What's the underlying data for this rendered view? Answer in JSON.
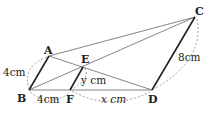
{
  "diagram": {
    "points": {
      "A": {
        "label": "A",
        "x": 49,
        "y": 56
      },
      "B": {
        "label": "B",
        "x": 29,
        "y": 90
      },
      "C": {
        "label": "C",
        "x": 195,
        "y": 17
      },
      "D": {
        "label": "D",
        "x": 152,
        "y": 90
      },
      "E": {
        "label": "E",
        "x": 83,
        "y": 67
      },
      "F": {
        "label": "F",
        "x": 70,
        "y": 90
      }
    },
    "labels": {
      "AB": "4cm",
      "BF": "4cm",
      "EF": "y cm",
      "FD": "x cm",
      "CD": "8cm"
    },
    "colors": {
      "line": "#555555",
      "thick": "#222222",
      "dash": "#777777"
    }
  }
}
